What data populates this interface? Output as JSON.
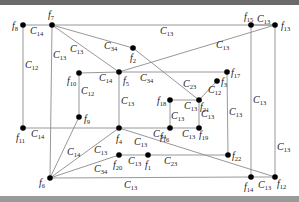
{
  "diagram": {
    "type": "graph",
    "nodes": [
      {
        "id": "f1",
        "x": 148,
        "y": 155,
        "label": "f",
        "sub": "1",
        "lx": 145,
        "ly": 168
      },
      {
        "id": "f2",
        "x": 133,
        "y": 48,
        "label": "f",
        "sub": "2",
        "lx": 130,
        "ly": 61
      },
      {
        "id": "f3",
        "x": 217,
        "y": 81,
        "label": "f",
        "sub": "3",
        "lx": 221,
        "ly": 85
      },
      {
        "id": "f4",
        "x": 119,
        "y": 128,
        "label": "f",
        "sub": "4",
        "lx": 116,
        "ly": 142
      },
      {
        "id": "f5",
        "x": 119,
        "y": 72,
        "label": "f",
        "sub": "5",
        "lx": 123,
        "ly": 84
      },
      {
        "id": "f6",
        "x": 50,
        "y": 178,
        "label": "f",
        "sub": "6",
        "lx": 39,
        "ly": 186
      },
      {
        "id": "f7",
        "x": 52,
        "y": 25,
        "label": "f",
        "sub": "7",
        "lx": 48,
        "ly": 18
      },
      {
        "id": "f8",
        "x": 23,
        "y": 25,
        "label": "f",
        "sub": "8",
        "lx": 12,
        "ly": 29
      },
      {
        "id": "f9",
        "x": 79,
        "y": 117,
        "label": "f",
        "sub": "9",
        "lx": 84,
        "ly": 122
      },
      {
        "id": "f10",
        "x": 79,
        "y": 73,
        "label": "f",
        "sub": "10",
        "lx": 67,
        "ly": 84
      },
      {
        "id": "f11",
        "x": 23,
        "y": 128,
        "label": "f",
        "sub": "11",
        "lx": 16,
        "ly": 141
      },
      {
        "id": "f12",
        "x": 275,
        "y": 177,
        "label": "f",
        "sub": "12",
        "lx": 277,
        "ly": 187
      },
      {
        "id": "f13",
        "x": 275,
        "y": 25,
        "label": "f",
        "sub": "13",
        "lx": 281,
        "ly": 29
      },
      {
        "id": "f14",
        "x": 251,
        "y": 177,
        "label": "f",
        "sub": "14",
        "lx": 244,
        "ly": 190
      },
      {
        "id": "f15",
        "x": 251,
        "y": 25,
        "label": "f",
        "sub": "15",
        "lx": 244,
        "ly": 20
      },
      {
        "id": "f16",
        "x": 170,
        "y": 128,
        "label": "f",
        "sub": "16",
        "lx": 160,
        "ly": 140
      },
      {
        "id": "f17",
        "x": 227,
        "y": 72,
        "label": "f",
        "sub": "17",
        "lx": 231,
        "ly": 76
      },
      {
        "id": "f18",
        "x": 170,
        "y": 100,
        "label": "f",
        "sub": "18",
        "lx": 157,
        "ly": 104
      },
      {
        "id": "f19",
        "x": 199,
        "y": 128,
        "label": "f",
        "sub": "19",
        "lx": 199,
        "ly": 138
      },
      {
        "id": "f20",
        "x": 119,
        "y": 155,
        "label": "f",
        "sub": "20",
        "lx": 113,
        "ly": 168
      },
      {
        "id": "f21",
        "x": 199,
        "y": 100,
        "label": "f",
        "sub": "21",
        "lx": 200,
        "ly": 110
      },
      {
        "id": "f22",
        "x": 228,
        "y": 155,
        "label": "f",
        "sub": "22",
        "lx": 232,
        "ly": 159
      }
    ],
    "edges": [
      {
        "from": "f8",
        "to": "f7",
        "label": "C",
        "sub": "14",
        "lx": 30,
        "ly": 34
      },
      {
        "from": "f7",
        "to": "f13",
        "label": "C",
        "sub": "13",
        "lx": 160,
        "ly": 34
      },
      {
        "from": "f15",
        "to": "f13",
        "label": "C",
        "sub": "13",
        "lx": 257,
        "ly": 22
      },
      {
        "from": "f8",
        "to": "f11",
        "label": "C",
        "sub": "12",
        "lx": 25,
        "ly": 68
      },
      {
        "from": "f7",
        "to": "f6",
        "label": "C",
        "sub": "13",
        "lx": 53,
        "ly": 58
      },
      {
        "from": "f7",
        "to": "f2",
        "label": "C",
        "sub": "34",
        "lx": 104,
        "ly": 49
      },
      {
        "from": "f7",
        "to": "f21",
        "label": "C",
        "sub": "13",
        "lx": 70,
        "ly": 52
      },
      {
        "from": "f5",
        "to": "f13",
        "label": "C",
        "sub": "13",
        "lx": 216,
        "ly": 48
      },
      {
        "from": "f10",
        "to": "f5",
        "label": "C",
        "sub": "14",
        "lx": 99,
        "ly": 81
      },
      {
        "from": "f5",
        "to": "f17",
        "label": "C",
        "sub": "34",
        "lx": 140,
        "ly": 81
      },
      {
        "from": "f10",
        "to": "f9",
        "label": "C",
        "sub": "12",
        "lx": 81,
        "ly": 94
      },
      {
        "from": "f5",
        "to": "f4",
        "label": "C",
        "sub": "13",
        "lx": 121,
        "ly": 104
      },
      {
        "from": "f7",
        "to": "f21",
        "label": "C",
        "sub": "23",
        "lx": 183,
        "ly": 87
      },
      {
        "from": "f21",
        "to": "f3",
        "label": "C",
        "sub": "12",
        "lx": 208,
        "ly": 93
      },
      {
        "from": "f18",
        "to": "f21",
        "label": "C",
        "sub": "13",
        "lx": 184,
        "ly": 109
      },
      {
        "from": "f18",
        "to": "f16",
        "label": "C",
        "sub": "13",
        "lx": 171,
        "ly": 119
      },
      {
        "from": "f21",
        "to": "f19",
        "label": "C",
        "sub": "13",
        "lx": 201,
        "ly": 117
      },
      {
        "from": "f17",
        "to": "f22",
        "label": "C",
        "sub": "13",
        "lx": 229,
        "ly": 115
      },
      {
        "from": "f15",
        "to": "f14",
        "label": "C",
        "sub": "13",
        "lx": 253,
        "ly": 103
      },
      {
        "from": "f13",
        "to": "f12",
        "label": "C",
        "sub": "13",
        "lx": 277,
        "ly": 150
      },
      {
        "from": "f11",
        "to": "f4",
        "label": "C",
        "sub": "14",
        "lx": 31,
        "ly": 137
      },
      {
        "from": "f4",
        "to": "f16",
        "label": "C",
        "sub": "34",
        "lx": 153,
        "ly": 137
      },
      {
        "from": "f16",
        "to": "f19",
        "label": "C",
        "sub": "13",
        "lx": 182,
        "ly": 137
      },
      {
        "from": "f9",
        "to": "f6",
        "label": "C",
        "sub": "14",
        "lx": 67,
        "ly": 155
      },
      {
        "from": "f4",
        "to": "f6",
        "label": "C",
        "sub": "13",
        "lx": 94,
        "ly": 153
      },
      {
        "from": "f4",
        "to": "f12",
        "label": "C",
        "sub": "13",
        "lx": 134,
        "ly": 145
      },
      {
        "from": "f20",
        "to": "f6",
        "label": "C",
        "sub": "34",
        "lx": 94,
        "ly": 172
      },
      {
        "from": "f20",
        "to": "f1",
        "label": "C",
        "sub": "13",
        "lx": 128,
        "ly": 164
      },
      {
        "from": "f1",
        "to": "f22",
        "label": "C",
        "sub": "23",
        "lx": 164,
        "ly": 164
      },
      {
        "from": "f6",
        "to": "f14",
        "label": "C",
        "sub": "13",
        "lx": 124,
        "ly": 188
      },
      {
        "from": "f14",
        "to": "f12",
        "label": "C",
        "sub": "13",
        "lx": 258,
        "ly": 188
      }
    ]
  }
}
